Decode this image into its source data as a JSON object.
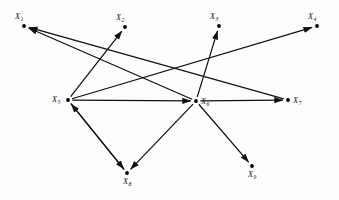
{
  "figure": {
    "type": "directed-graph",
    "title": "",
    "background_color": "#fdfdfd",
    "edge_color": "#111111",
    "node_color": "#000000"
  },
  "nodes": [
    {
      "id": "X1",
      "label": "X",
      "subscript": "1",
      "x": 24,
      "y": 26,
      "label_dx": -9,
      "label_dy": -7
    },
    {
      "id": "X2",
      "label": "X",
      "subscript": "2",
      "x": 125,
      "y": 27,
      "label_dx": -9,
      "label_dy": -7
    },
    {
      "id": "X3",
      "label": "X",
      "subscript": "3",
      "x": 219,
      "y": 26,
      "label_dx": -9,
      "label_dy": -7
    },
    {
      "id": "X4",
      "label": "X",
      "subscript": "4",
      "x": 317,
      "y": 26,
      "label_dx": -9,
      "label_dy": -7
    },
    {
      "id": "X5",
      "label": "X",
      "subscript": "5",
      "x": 68,
      "y": 100,
      "label_dx": -16,
      "label_dy": 2
    },
    {
      "id": "X6",
      "label": "X",
      "subscript": "6",
      "x": 196,
      "y": 101,
      "label_dx": 5,
      "label_dy": 3
    },
    {
      "id": "X7",
      "label": "X",
      "subscript": "7",
      "x": 288,
      "y": 100,
      "label_dx": 5,
      "label_dy": 3
    },
    {
      "id": "X8",
      "label": "X",
      "subscript": "8",
      "x": 127,
      "y": 173,
      "label_dx": -4,
      "label_dy": 11
    },
    {
      "id": "X9",
      "label": "X",
      "subscript": "9",
      "x": 252,
      "y": 166,
      "label_dx": -4,
      "label_dy": 11
    }
  ],
  "edges": [
    {
      "id": "e1",
      "from": "X5",
      "to": "X2",
      "arrow": "to"
    },
    {
      "id": "e2",
      "from": "X5",
      "to": "X6",
      "arrow": "to"
    },
    {
      "id": "e3",
      "from": "X5",
      "to": "X8",
      "arrow": "to"
    },
    {
      "id": "e4",
      "from": "X5",
      "to": "X4",
      "arrow": "to"
    },
    {
      "id": "e5",
      "from": "X6",
      "to": "X1",
      "arrow": "to"
    },
    {
      "id": "e6",
      "from": "X6",
      "to": "X3",
      "arrow": "to"
    },
    {
      "id": "e7",
      "from": "X6",
      "to": "X9",
      "arrow": "to"
    },
    {
      "id": "e8",
      "from": "X6",
      "to": "X8",
      "arrow": "to"
    },
    {
      "id": "e9",
      "from": "X6",
      "to": "X7",
      "arrow": "to"
    },
    {
      "id": "e10",
      "from": "X8",
      "to": "X5",
      "arrow": "to"
    },
    {
      "id": "e11",
      "from": "X7",
      "to": "X1",
      "arrow": "to"
    }
  ]
}
